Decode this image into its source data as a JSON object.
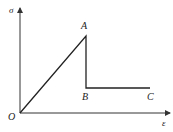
{
  "diagram": {
    "type": "stress-strain curve",
    "axes": {
      "y_label": "σ",
      "x_label": "ε",
      "origin_label": "O"
    },
    "points": [
      {
        "label": "O"
      },
      {
        "label": "A"
      },
      {
        "label": "B"
      },
      {
        "label": "C"
      }
    ],
    "segments": [
      "O-A",
      "A-B",
      "B-C"
    ],
    "colors": {
      "line": "#222222",
      "axis": "#333333",
      "background": "#ffffff"
    }
  }
}
